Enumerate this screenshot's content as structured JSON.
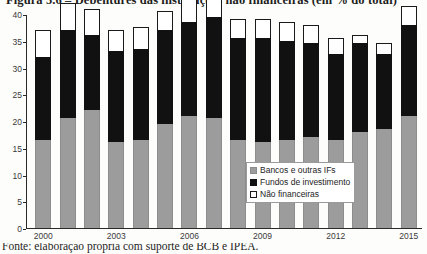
{
  "figure": {
    "title_partial": "Figura 5.6 – Debêntures das instituições não financeiras (em % do total)",
    "source_partial": "Fonte: elaboração própria com suporte de BCB e IPEA."
  },
  "legend": {
    "position": "inside-bottom-right",
    "items": [
      {
        "label": "Bancos e outras IFs",
        "swatch": "gray-swatch",
        "color": "#9c9c9c"
      },
      {
        "label": "Fundos de investimento",
        "swatch": "black-swatch",
        "color": "#111111"
      },
      {
        "label": "Não financeiras",
        "swatch": "white-swatch",
        "color": "#ffffff"
      }
    ]
  },
  "chart_data": {
    "type": "bar",
    "stacked": true,
    "title": "Figura 5.6 – Debêntures das instituições não financeiras (em % do total)",
    "xlabel": "",
    "ylabel": "",
    "ylim": [
      0,
      40
    ],
    "yticks": [
      0,
      5,
      10,
      15,
      20,
      25,
      30,
      35,
      40
    ],
    "ytick_labels": [
      "0",
      "5",
      "10",
      "15",
      "20",
      "25",
      "30",
      "35",
      "40"
    ],
    "grid": false,
    "categories": [
      "2000",
      "2001",
      "2002",
      "2003",
      "2004",
      "2005",
      "2006",
      "2007",
      "2008",
      "2009",
      "2010",
      "2011",
      "2012",
      "2013",
      "2014",
      "2015"
    ],
    "xtick_labels_shown": [
      "2000",
      "2003",
      "2006",
      "2009",
      "2012",
      "2015"
    ],
    "series": [
      {
        "name": "Bancos e outras IFs",
        "color": "#9c9c9c",
        "values": [
          16.5,
          20.5,
          22.0,
          16.0,
          16.5,
          19.5,
          21.0,
          20.5,
          16.5,
          16.0,
          16.5,
          17.0,
          16.5,
          18.0,
          18.5,
          21.0
        ]
      },
      {
        "name": "Fundos de investimento",
        "color": "#111111",
        "values": [
          15.5,
          16.5,
          14.0,
          17.0,
          17.0,
          17.5,
          17.5,
          19.0,
          19.0,
          19.5,
          18.5,
          17.5,
          16.0,
          16.5,
          14.0,
          17.0
        ]
      },
      {
        "name": "Não financeiras",
        "color": "#ffffff",
        "values": [
          5.0,
          5.0,
          5.0,
          4.0,
          4.0,
          3.5,
          4.5,
          3.5,
          3.5,
          3.5,
          3.5,
          3.5,
          3.0,
          1.5,
          2.0,
          3.5
        ]
      }
    ],
    "totals": [
      37.0,
      42.0,
      41.0,
      37.0,
      37.5,
      40.5,
      43.0,
      43.0,
      39.0,
      39.0,
      38.5,
      38.0,
      35.5,
      36.0,
      34.5,
      41.5
    ]
  }
}
